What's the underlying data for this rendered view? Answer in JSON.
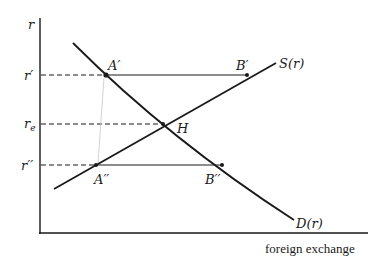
{
  "diagram": {
    "axes": {
      "y_label": "r",
      "x_label": "foreign exchange"
    },
    "levels": [
      {
        "id": "r_prime",
        "label": "r′",
        "y": 75
      },
      {
        "id": "r_e",
        "label": "r",
        "sub": "e",
        "y": 124
      },
      {
        "id": "r_double_prime",
        "label": "r′′",
        "y": 165
      }
    ],
    "curves": {
      "supply": {
        "label": "S(r)"
      },
      "demand": {
        "label": "D(r)"
      }
    },
    "points": {
      "A_prime": {
        "label": "A′"
      },
      "B_prime": {
        "label": "B′"
      },
      "H": {
        "label": "H"
      },
      "A_double_prime": {
        "label": "A′′"
      },
      "B_double_prime": {
        "label": "B′′"
      }
    },
    "colors": {
      "ink": "#1a1a1a",
      "faint": "#bdbdbd",
      "background": "#ffffff"
    }
  }
}
